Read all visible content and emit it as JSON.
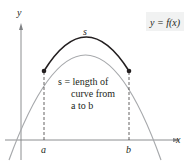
{
  "diagram": {
    "axes": {
      "x_label": "x",
      "y_label": "y"
    },
    "function_label": "y = f(x)",
    "arc_label": "s",
    "points": [
      {
        "name": "a",
        "label": "a"
      },
      {
        "name": "b",
        "label": "b"
      }
    ],
    "annotation": {
      "line1": "s = length of",
      "line2": "curve from",
      "line3": "a to b"
    },
    "colors": {
      "curve_highlight": "#231f20",
      "curve_base": "#a7a9ac",
      "axes": "#808285",
      "label_box": "#f1f2f2",
      "text": "#231f20"
    }
  }
}
